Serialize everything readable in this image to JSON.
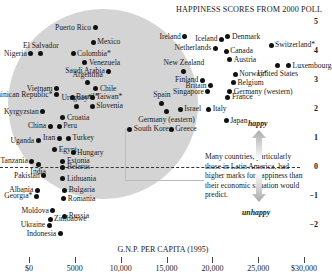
{
  "chart_data": {
    "type": "scatter",
    "title": "HAPPINESS SCORES FROM 2000 POLL",
    "xlabel": "G.N.P. PER CAPITA (1995)",
    "ylabel": "",
    "xlim": [
      0,
      30000
    ],
    "ylim": [
      -2,
      5
    ],
    "x_tick_labels": [
      "$0",
      "5000",
      "10,000",
      "15,000",
      "20,000",
      "25,000",
      "$30,000"
    ],
    "x_ticks": [
      0,
      5000,
      10000,
      15000,
      20000,
      25000,
      30000
    ],
    "y_tick_labels": [
      "5",
      "4",
      "3",
      "2",
      "1",
      "0",
      "−1",
      "−2"
    ],
    "y_ticks": [
      5,
      4,
      3,
      2,
      1,
      0,
      -1,
      -2
    ],
    "grid": false,
    "reference_line": {
      "y": 0,
      "style": "dashed"
    },
    "annotations": {
      "happy": "happy",
      "unhappy": "unhappy",
      "callout": "Many countries, particularly those in Latin America, had higher marks for happiness than their economic situation would predict.",
      "highlight": "gray circle around Latin American and other over-performing countries"
    },
    "points": [
      {
        "label": "Puerto Rico",
        "x": 7200,
        "y": 4.8
      },
      {
        "label": "Mexico",
        "x": 7000,
        "y": 4.3
      },
      {
        "label": "El Salvador",
        "x": 1300,
        "y": 3.9
      },
      {
        "label": "Nigeria",
        "x": 200,
        "y": 3.9
      },
      {
        "label": "Colombia*",
        "x": 4800,
        "y": 3.9
      },
      {
        "label": "Venezuela",
        "x": 6100,
        "y": 3.6
      },
      {
        "label": "Saudi Arabia",
        "x": 8700,
        "y": 3.3
      },
      {
        "label": "Argentina",
        "x": 6400,
        "y": 2.9
      },
      {
        "label": "Chile",
        "x": 7300,
        "y": 2.7
      },
      {
        "label": "Vietnam",
        "x": 3000,
        "y": 2.7
      },
      {
        "label": "Dominican Republic*",
        "x": 3000,
        "y": 2.5
      },
      {
        "label": "Brazil*",
        "x": 4700,
        "y": 2.4
      },
      {
        "label": "Taiwan*",
        "x": 6900,
        "y": 2.4
      },
      {
        "label": "Uruguay*",
        "x": 5200,
        "y": 2.1
      },
      {
        "label": "Slovenia",
        "x": 6900,
        "y": 2.1
      },
      {
        "label": "Kyrgyzstan",
        "x": 1500,
        "y": 1.9
      },
      {
        "label": "Croatia",
        "x": 3700,
        "y": 1.7
      },
      {
        "label": "China",
        "x": 2300,
        "y": 1.4
      },
      {
        "label": "Peru",
        "x": 3300,
        "y": 1.4
      },
      {
        "label": "South Korea",
        "x": 11000,
        "y": 1.3
      },
      {
        "label": "Iran",
        "x": 3300,
        "y": 1.0
      },
      {
        "label": "Turkey",
        "x": 4300,
        "y": 1.0
      },
      {
        "label": "Uganda",
        "x": 1000,
        "y": 0.9
      },
      {
        "label": "Egypt",
        "x": 2800,
        "y": 0.6
      },
      {
        "label": "Hungary",
        "x": 4800,
        "y": 0.5
      },
      {
        "label": "Tanzania",
        "x": 300,
        "y": 0.2
      },
      {
        "label": "Estonia",
        "x": 3700,
        "y": 0.2
      },
      {
        "label": "India",
        "x": 1000,
        "y": 0.1
      },
      {
        "label": "Belarus",
        "x": 3700,
        "y": 0.0
      },
      {
        "label": "Pakistan",
        "x": 1600,
        "y": -0.3
      },
      {
        "label": "Lithuania",
        "x": 3700,
        "y": -0.4
      },
      {
        "label": "Albania",
        "x": 900,
        "y": -0.8
      },
      {
        "label": "Bulgaria",
        "x": 3900,
        "y": -0.8
      },
      {
        "label": "Georgia*",
        "x": 800,
        "y": -1.0
      },
      {
        "label": "Romania",
        "x": 3800,
        "y": -1.1
      },
      {
        "label": "Moldova",
        "x": 2600,
        "y": -1.5
      },
      {
        "label": "Russia",
        "x": 3900,
        "y": -1.7
      },
      {
        "label": "Ukraine",
        "x": 2200,
        "y": -2.0
      },
      {
        "label": "Zimbabwe",
        "x": 2300,
        "y": -1.8
      },
      {
        "label": "Indonesia",
        "x": 3400,
        "y": -2.3
      },
      {
        "label": "Ireland",
        "x": 17000,
        "y": 4.5
      },
      {
        "label": "Iceland",
        "x": 21000,
        "y": 4.4
      },
      {
        "label": "Denmark",
        "x": 21700,
        "y": 4.5
      },
      {
        "label": "Netherlands",
        "x": 20300,
        "y": 4.1
      },
      {
        "label": "Canada",
        "x": 21500,
        "y": 4.0
      },
      {
        "label": "Austria",
        "x": 21900,
        "y": 3.7
      },
      {
        "label": "Switzerland*",
        "x": 26400,
        "y": 4.2
      },
      {
        "label": "Luxembourg",
        "x": 28300,
        "y": 3.5
      },
      {
        "label": "United States",
        "x": 27100,
        "y": 3.5
      },
      {
        "label": "New Zealand",
        "x": 16900,
        "y": 3.3
      },
      {
        "label": "Finland",
        "x": 18900,
        "y": 3.0
      },
      {
        "label": "Norway*",
        "x": 22500,
        "y": 3.2
      },
      {
        "label": "Britain",
        "x": 19800,
        "y": 2.8
      },
      {
        "label": "Belgium",
        "x": 22300,
        "y": 2.9
      },
      {
        "label": "Singapore",
        "x": 19500,
        "y": 2.6
      },
      {
        "label": "Germany (western)",
        "x": 21900,
        "y": 2.6
      },
      {
        "label": "France",
        "x": 21700,
        "y": 2.4
      },
      {
        "label": "Spain",
        "x": 14500,
        "y": 2.2
      },
      {
        "label": "Israel",
        "x": 16500,
        "y": 2.0
      },
      {
        "label": "Germany (eastern)",
        "x": 15000,
        "y": 1.9
      },
      {
        "label": "Italy",
        "x": 19600,
        "y": 2.0
      },
      {
        "label": "Japan",
        "x": 21500,
        "y": 1.6
      },
      {
        "label": "Greece",
        "x": 15500,
        "y": 1.3
      }
    ]
  },
  "labels": {
    "title": "HAPPINESS SCORES FROM 2000 POLL",
    "xlabel": "G.N.P. PER CAPITA (1995)",
    "happy": "happy",
    "unhappy": "unhappy",
    "callout": "Many countries, particularly those in Latin America, had higher marks for happiness than their economic situation would predict."
  }
}
